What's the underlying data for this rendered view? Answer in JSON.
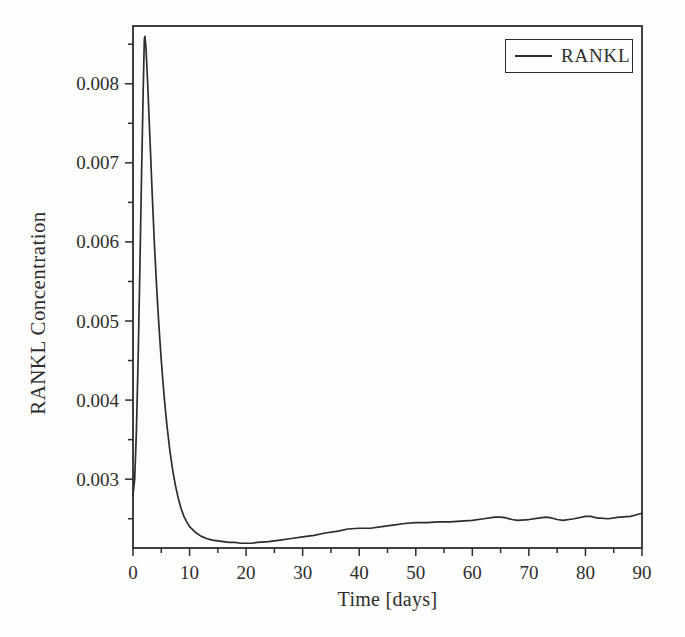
{
  "figure": {
    "background_color": "#fdfdfc",
    "ink_color": "#2d2d2d"
  },
  "chart_data": {
    "type": "line",
    "title": "",
    "xlabel": "Time [days]",
    "ylabel": "RANKL Concentration",
    "xlim": [
      0,
      90
    ],
    "ylim": [
      0.00213,
      0.00873
    ],
    "grid": false,
    "x_ticks_major": [
      0,
      10,
      20,
      30,
      40,
      50,
      60,
      70,
      80,
      90
    ],
    "x_tick_labels": [
      "0",
      "10",
      "20",
      "30",
      "40",
      "50",
      "60",
      "70",
      "80",
      "90"
    ],
    "x_ticks_minor": [
      5,
      15,
      25,
      35,
      45,
      55,
      65,
      75,
      85
    ],
    "y_ticks_major": [
      0.003,
      0.004,
      0.005,
      0.006,
      0.007,
      0.008
    ],
    "y_tick_labels": [
      "0.003",
      "0.004",
      "0.005",
      "0.006",
      "0.007",
      "0.008"
    ],
    "y_ticks_minor": [
      0.0025,
      0.0035,
      0.0045,
      0.0055,
      0.0065,
      0.0075,
      0.0085
    ],
    "legend": {
      "position": "top-right",
      "entries": [
        {
          "label": "RANKL",
          "line_color": "#2d2d2d"
        }
      ]
    },
    "series": [
      {
        "name": "RANKL",
        "color": "#2d2d2d",
        "points": [
          [
            0,
            0.0028
          ],
          [
            0.3,
            0.003
          ],
          [
            0.6,
            0.0036
          ],
          [
            0.9,
            0.0045
          ],
          [
            1.2,
            0.0056
          ],
          [
            1.5,
            0.0068
          ],
          [
            1.8,
            0.0079
          ],
          [
            2.0,
            0.00855
          ],
          [
            2.1,
            0.0086
          ],
          [
            2.3,
            0.00845
          ],
          [
            2.6,
            0.008
          ],
          [
            3.0,
            0.0073
          ],
          [
            3.4,
            0.0066
          ],
          [
            3.8,
            0.00595
          ],
          [
            4.2,
            0.0054
          ],
          [
            4.6,
            0.00492
          ],
          [
            5.0,
            0.0045
          ],
          [
            5.5,
            0.00405
          ],
          [
            6.0,
            0.00368
          ],
          [
            6.5,
            0.00337
          ],
          [
            7.0,
            0.00312
          ],
          [
            7.5,
            0.00292
          ],
          [
            8.0,
            0.00276
          ],
          [
            8.5,
            0.00263
          ],
          [
            9.0,
            0.00253
          ],
          [
            9.5,
            0.00246
          ],
          [
            10,
            0.0024
          ],
          [
            11,
            0.00233
          ],
          [
            12,
            0.00228
          ],
          [
            13,
            0.00225
          ],
          [
            14,
            0.00223
          ],
          [
            15,
            0.00222
          ],
          [
            16,
            0.00221
          ],
          [
            17,
            0.0022
          ],
          [
            18,
            0.0022
          ],
          [
            19,
            0.00219
          ],
          [
            20,
            0.00219
          ],
          [
            21,
            0.00219
          ],
          [
            22,
            0.0022
          ],
          [
            24,
            0.00221
          ],
          [
            26,
            0.00223
          ],
          [
            28,
            0.00225
          ],
          [
            30,
            0.00227
          ],
          [
            32,
            0.00229
          ],
          [
            34,
            0.00232
          ],
          [
            36,
            0.00234
          ],
          [
            38,
            0.00237
          ],
          [
            40,
            0.00238
          ],
          [
            42,
            0.00238
          ],
          [
            44,
            0.0024
          ],
          [
            46,
            0.00242
          ],
          [
            48,
            0.00244
          ],
          [
            50,
            0.00245
          ],
          [
            52,
            0.00245
          ],
          [
            54,
            0.00246
          ],
          [
            56,
            0.00246
          ],
          [
            58,
            0.00247
          ],
          [
            60,
            0.00248
          ],
          [
            62,
            0.0025
          ],
          [
            64,
            0.00252
          ],
          [
            65,
            0.00252
          ],
          [
            66,
            0.00251
          ],
          [
            67,
            0.00249
          ],
          [
            68,
            0.00248
          ],
          [
            70,
            0.00249
          ],
          [
            72,
            0.00251
          ],
          [
            73,
            0.00252
          ],
          [
            74,
            0.00251
          ],
          [
            75,
            0.00249
          ],
          [
            76,
            0.00248
          ],
          [
            78,
            0.0025
          ],
          [
            80,
            0.00253
          ],
          [
            81,
            0.00253
          ],
          [
            82,
            0.00251
          ],
          [
            84,
            0.0025
          ],
          [
            86,
            0.00252
          ],
          [
            88,
            0.00253
          ],
          [
            89,
            0.00255
          ],
          [
            90,
            0.00257
          ]
        ]
      }
    ]
  }
}
